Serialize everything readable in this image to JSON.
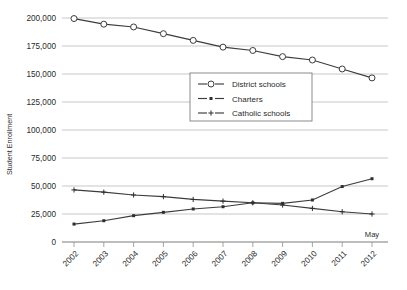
{
  "chart_data": {
    "type": "line",
    "title": "",
    "xlabel": "",
    "ylabel": "Student Enrollment",
    "x": [
      "2002",
      "2003",
      "2004",
      "2005",
      "2006",
      "2007",
      "2008",
      "2009",
      "2010",
      "2011",
      "2012"
    ],
    "categories": [
      "2002",
      "2003",
      "2004",
      "2005",
      "2006",
      "2007",
      "2008",
      "2009",
      "2010",
      "2011",
      "2012"
    ],
    "ylim": [
      0,
      200000
    ],
    "yticks": [
      0,
      25000,
      50000,
      75000,
      100000,
      125000,
      150000,
      175000,
      200000
    ],
    "ytick_labels": [
      "0",
      "25,000",
      "50,000",
      "75,000",
      "100,000",
      "125,000",
      "150,000",
      "175,000",
      "200,000"
    ],
    "grid": true,
    "legend_position": "upper center",
    "annotations": [
      {
        "text": "May",
        "x": "2012",
        "placement": "above-axis-right"
      }
    ],
    "series": [
      {
        "name": "District schools",
        "marker": "open-circle",
        "values": [
          199500,
          194500,
          192000,
          186000,
          180000,
          174000,
          171000,
          165500,
          162500,
          154500,
          146500
        ]
      },
      {
        "name": "Charters",
        "marker": "small-filled-square",
        "values": [
          16000,
          19000,
          23500,
          26500,
          29500,
          31500,
          35000,
          34500,
          37500,
          49500,
          56500
        ]
      },
      {
        "name": "Catholic schools",
        "marker": "plus",
        "values": [
          46500,
          44500,
          42000,
          40500,
          38000,
          36500,
          35000,
          33000,
          30000,
          27000,
          25000
        ]
      }
    ]
  },
  "legend": {
    "items": [
      {
        "label": "District schools"
      },
      {
        "label": "Charters"
      },
      {
        "label": "Catholic schools"
      }
    ]
  },
  "axes": {
    "y_title": "Student Enrollment"
  },
  "colors": {
    "line": "#3c3c3c",
    "grid": "#b9b9b9",
    "axis": "#8f8f8f",
    "text": "#2b2b2b",
    "background": "#ffffff"
  }
}
